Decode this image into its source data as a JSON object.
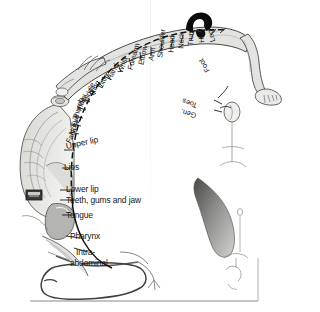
{
  "figure": {
    "colors": {
      "ink": "#141414",
      "outline": "#3a3a3a",
      "body_fill": "#e3e3e1",
      "body_fill_dark": "#c9c9c7",
      "shade_gray": "#a8a8a6",
      "dark_gray": "#6e6e6c",
      "background": "#ffffff"
    },
    "radial_labels": [
      {
        "text": "Face",
        "x": 68,
        "y": 139,
        "rot": -62
      },
      {
        "text": "Nose",
        "x": 71,
        "y": 131,
        "rot": -68
      },
      {
        "text": "Eye",
        "x": 73,
        "y": 123,
        "rot": -72
      },
      {
        "text": "Thumb",
        "x": 75,
        "y": 117,
        "rot": -76
      },
      {
        "text": "Index",
        "x": 79,
        "y": 109,
        "rot": -74
      },
      {
        "text": "Middle",
        "x": 85,
        "y": 101,
        "rot": -70
      },
      {
        "text": "Ring",
        "x": 92,
        "y": 94,
        "rot": -68
      },
      {
        "text": "Little",
        "x": 100,
        "y": 87,
        "rot": -66
      },
      {
        "text": "Hand",
        "x": 110,
        "y": 81,
        "rot": -66
      },
      {
        "text": "Wrist",
        "x": 123,
        "y": 76,
        "rot": -72
      },
      {
        "text": "Forearm",
        "x": 131,
        "y": 76,
        "rot": -76
      },
      {
        "text": "Elbow",
        "x": 142,
        "y": 73,
        "rot": -80
      },
      {
        "text": "Arm",
        "x": 152,
        "y": 70,
        "rot": -82
      },
      {
        "text": "Shoulder",
        "x": 160,
        "y": 73,
        "rot": -86
      },
      {
        "text": "Head",
        "x": 172,
        "y": 68,
        "rot": -88
      },
      {
        "text": "Neck",
        "x": 181,
        "y": 68,
        "rot": -90
      },
      {
        "text": "Trunk",
        "x": 191,
        "y": 69,
        "rot": -92
      },
      {
        "text": "Hip",
        "x": 201,
        "y": 66,
        "rot": -96
      },
      {
        "text": "Leg",
        "x": 211,
        "y": 67,
        "rot": -104
      },
      {
        "text": "Foot",
        "x": 209,
        "y": 77,
        "rot": -118
      },
      {
        "text": "Toes",
        "x": 206,
        "y": 94,
        "rot": -148
      },
      {
        "text": "Gen.",
        "x": 205,
        "y": 104,
        "rot": -160
      }
    ],
    "flat_labels": [
      {
        "text": "Upper lip",
        "x": 96,
        "y": 148
      },
      {
        "text": "Lips",
        "x": 92,
        "y": 167
      },
      {
        "text": "Lower lip",
        "x": 96,
        "y": 188
      },
      {
        "text": "Teeth, gums and jaw",
        "x": 96,
        "y": 199
      },
      {
        "text": "Tongue",
        "x": 96,
        "y": 213
      },
      {
        "text": "Pharynx",
        "x": 96,
        "y": 236
      },
      {
        "text": "Intra-",
        "x": 100,
        "y": 251
      },
      {
        "text": "abdominal",
        "x": 96,
        "y": 261
      }
    ],
    "anatomical_insets": [
      {
        "name": "hand-and-fingers",
        "position": "upper-left of homunculus"
      },
      {
        "name": "head-with-black-hair",
        "position": "top center"
      },
      {
        "name": "leg-and-foot-with-toes",
        "position": "upper right"
      },
      {
        "name": "genital-inset",
        "position": "right of Gen. label"
      },
      {
        "name": "tongue-gray-shape",
        "position": "mid right"
      },
      {
        "name": "pharynx-outline",
        "position": "lower right"
      },
      {
        "name": "intra-abdominal-viscera",
        "position": "bottom center"
      },
      {
        "name": "cortex-gyri-shading",
        "position": "left flank"
      }
    ]
  }
}
